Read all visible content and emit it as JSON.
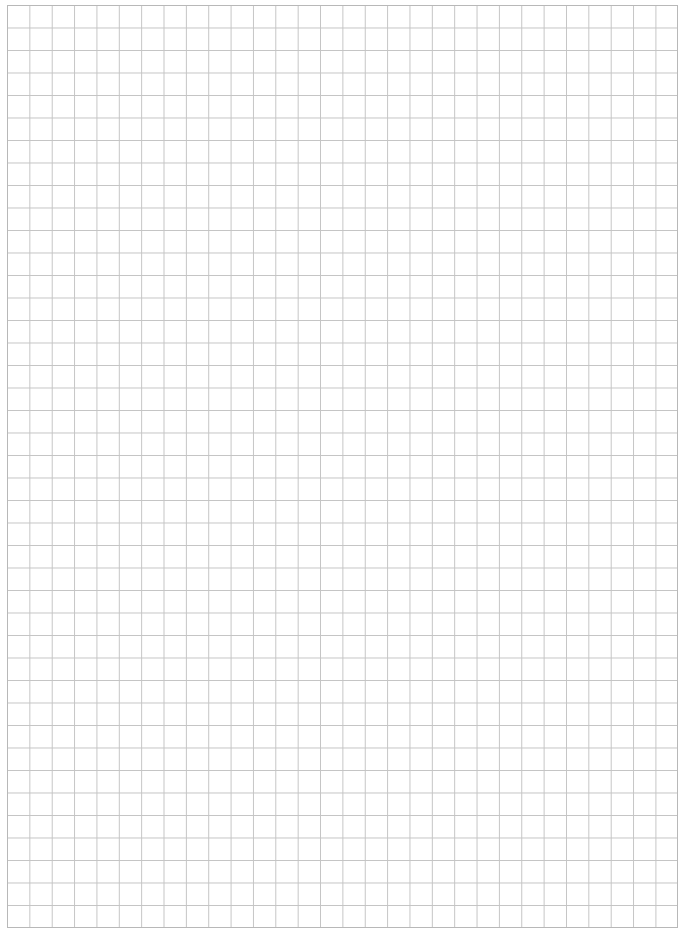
{
  "document": {
    "type": "graph-paper",
    "grid": {
      "columns": 30,
      "rows": 41,
      "line_color": "#c4c4c4",
      "border_color": "#b8b8b8",
      "background": "#ffffff"
    },
    "footer": {
      "page_number_visible": "partially cut off (unreadable)"
    }
  }
}
